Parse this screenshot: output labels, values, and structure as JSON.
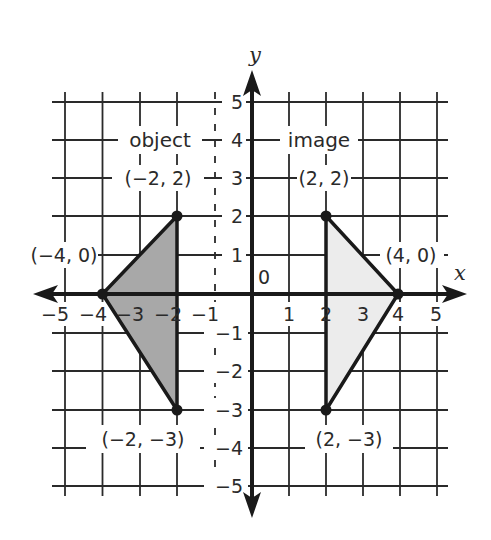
{
  "diagram": {
    "axes": {
      "x_label": "x",
      "y_label": "y",
      "origin_label": "0",
      "x_ticks": [
        {
          "value": -5,
          "label": "−5"
        },
        {
          "value": -4,
          "label": "−4"
        },
        {
          "value": -3,
          "label": "−3"
        },
        {
          "value": -2,
          "label": "−2"
        },
        {
          "value": -1,
          "label": "−1"
        },
        {
          "value": 1,
          "label": "1"
        },
        {
          "value": 2,
          "label": "2"
        },
        {
          "value": 3,
          "label": "3"
        },
        {
          "value": 4,
          "label": "4"
        },
        {
          "value": 5,
          "label": "5"
        }
      ],
      "y_ticks": [
        {
          "value": 5,
          "label": "5"
        },
        {
          "value": 4,
          "label": "4"
        },
        {
          "value": 3,
          "label": "3"
        },
        {
          "value": 2,
          "label": "2"
        },
        {
          "value": 1,
          "label": "1"
        },
        {
          "value": -1,
          "label": "−1"
        },
        {
          "value": -2,
          "label": "−2"
        },
        {
          "value": -3,
          "label": "−3"
        },
        {
          "value": -4,
          "label": "−4"
        },
        {
          "value": -5,
          "label": "−5"
        }
      ],
      "range": {
        "x": [
          -5,
          5
        ],
        "y": [
          -5,
          5
        ]
      }
    },
    "shapes": {
      "object": {
        "label": "object",
        "fill": "#a8a8a8",
        "vertices": [
          [
            -2,
            2
          ],
          [
            -4,
            0
          ],
          [
            -2,
            -3
          ]
        ],
        "vertex_labels": [
          "(−2, 2)",
          "(−4, 0)",
          "(−2, −3)"
        ]
      },
      "image": {
        "label": "image",
        "fill": "#ececec",
        "vertices": [
          [
            2,
            2
          ],
          [
            4,
            0
          ],
          [
            2,
            -3
          ]
        ],
        "vertex_labels": [
          "(2, 2)",
          "(4, 0)",
          "(2, −3)"
        ]
      }
    },
    "colors": {
      "ink": "#1a1a1a",
      "grid": "#2a2a2a",
      "background": "#ffffff"
    }
  }
}
